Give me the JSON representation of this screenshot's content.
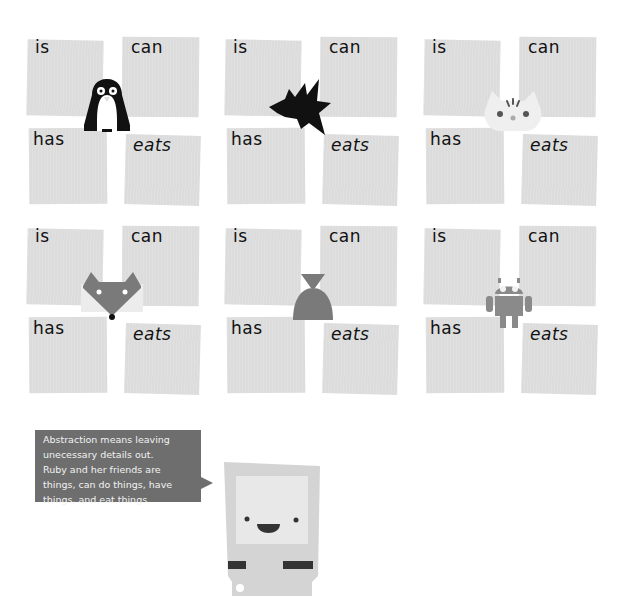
{
  "panels": [
    {
      "animal": "penguin",
      "labels": {
        "is": "is",
        "can": "can",
        "has": "has",
        "eats": "eats"
      }
    },
    {
      "animal": "bird",
      "labels": {
        "is": "is",
        "can": "can",
        "has": "has",
        "eats": "eats"
      }
    },
    {
      "animal": "cat",
      "labels": {
        "is": "is",
        "can": "can",
        "has": "has",
        "eats": "eats"
      }
    },
    {
      "animal": "fox",
      "labels": {
        "is": "is",
        "can": "can",
        "has": "has",
        "eats": "eats"
      }
    },
    {
      "animal": "bell",
      "labels": {
        "is": "is",
        "can": "can",
        "has": "has",
        "eats": "eats"
      }
    },
    {
      "animal": "android-robot",
      "labels": {
        "is": "is",
        "can": "can",
        "has": "has",
        "eats": "eats"
      }
    }
  ],
  "speech_bubble": {
    "lines": [
      "Abstraction means leaving",
      "unecessary details out.",
      "Ruby and her friends are",
      "things, can do things, have",
      "things, and eat things."
    ]
  },
  "character": {
    "name": "ruby-computer"
  },
  "colors": {
    "card": "#dcdcdc",
    "bubble": "#6e6e6e",
    "ink": "#111111",
    "animal_gray": "#7a7a7a"
  }
}
